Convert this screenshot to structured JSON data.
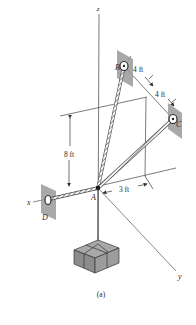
{
  "figure": {
    "caption": "(a)",
    "axes": {
      "x": "x",
      "y": "y",
      "z": "z"
    },
    "points": {
      "A": "A",
      "B": "B",
      "C": "C",
      "D": "D"
    },
    "dimensions": {
      "height": "8 ft",
      "bc_first": "4 ft",
      "bc_second": "4 ft",
      "offset": "3 ft"
    },
    "colors": {
      "line": "#3a3a3a",
      "plate": "#9a9a9a",
      "box_top": "#a8a8a8",
      "box_side": "#8c8c8c",
      "cable": "#555555"
    }
  }
}
